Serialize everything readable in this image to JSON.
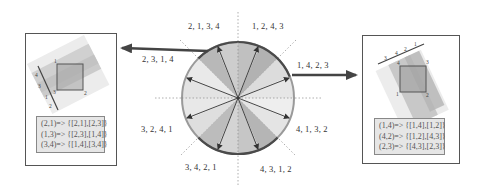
{
  "sectors": {
    "top_left": "2, 1, 3, 4",
    "top_right": "1, 2, 4, 3",
    "upper_left_arrow": "2, 3, 1, 4",
    "upper_right_arrow": "1, 4, 2, 3",
    "lower_left": "3, 2, 4, 1",
    "lower_right": "4, 1, 3, 2",
    "bottom_left": "3, 4, 2, 1",
    "bottom_right": "4, 3, 1, 2"
  },
  "left_panel": {
    "axis_labels": [
      "4",
      "3",
      "1",
      "2"
    ],
    "corner_labels": [
      "1",
      "3",
      "2"
    ],
    "mappings": [
      "(2,1)=> {[2,1],[2,3]}",
      "(1,3)=> {[2,3],[1,4]}",
      "(3,4)=> {[1,4],[3,4]}"
    ]
  },
  "right_panel": {
    "axis_labels": [
      "3",
      "4",
      "2",
      "1"
    ],
    "corner_labels": [
      "4",
      "3",
      "1",
      "2"
    ],
    "mappings": [
      "(1,4)=> {[1,4],[1,2]}",
      "(4,2)=> {[1,2],[4,3]}",
      "(2,3)=> {[4,3],[2,3]}"
    ]
  },
  "colors": {
    "dark_sector": "#a9a9a9",
    "mid_sector": "#c4c4c4",
    "light_sector": "#dcdcdc",
    "lighter_sector": "#ebebeb",
    "arrow": "#3a3a3a",
    "rim_dark": "#444444",
    "rim_light": "#999999"
  }
}
